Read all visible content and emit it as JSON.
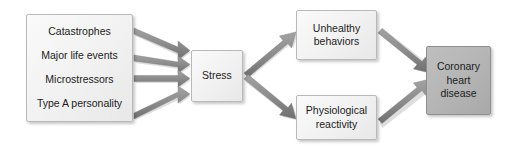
{
  "diagram": {
    "type": "flowchart",
    "background_color": "#ffffff",
    "node_fill_light": "#f1f1f1",
    "node_fill_dark": "#b4b4b4",
    "node_border_color": "#b9b9b9",
    "arrow_color": "#8c8c8c",
    "text_color": "#1c1c1c"
  },
  "nodes": {
    "sources": {
      "name": "stressor-sources",
      "style": "light",
      "lines": [
        "Catastrophes",
        "Major life events",
        "Microstressors",
        "Type A personality"
      ]
    },
    "stress": {
      "name": "stress",
      "style": "light",
      "label": "Stress"
    },
    "unhealthy": {
      "name": "unhealthy-behaviors",
      "style": "light",
      "line1": "Unhealthy",
      "line2": "behaviors"
    },
    "physiological": {
      "name": "physiological-reactivity",
      "style": "light",
      "line1": "Physiological",
      "line2": "reactivity"
    },
    "chd": {
      "name": "coronary-heart-disease",
      "style": "dark",
      "line1": "Coronary",
      "line2": "heart",
      "line3": "disease"
    }
  },
  "edges": [
    {
      "name": "catastrophes-to-stress",
      "from": "sources",
      "to": "stress"
    },
    {
      "name": "major-life-events-to-stress",
      "from": "sources",
      "to": "stress"
    },
    {
      "name": "microstressors-to-stress",
      "from": "sources",
      "to": "stress"
    },
    {
      "name": "type-a-personality-to-stress",
      "from": "sources",
      "to": "stress"
    },
    {
      "name": "stress-to-unhealthy-behaviors",
      "from": "stress",
      "to": "unhealthy"
    },
    {
      "name": "stress-to-physiological-reactivity",
      "from": "stress",
      "to": "physiological"
    },
    {
      "name": "unhealthy-behaviors-to-chd",
      "from": "unhealthy",
      "to": "chd"
    },
    {
      "name": "physiological-reactivity-to-chd",
      "from": "physiological",
      "to": "chd"
    }
  ]
}
